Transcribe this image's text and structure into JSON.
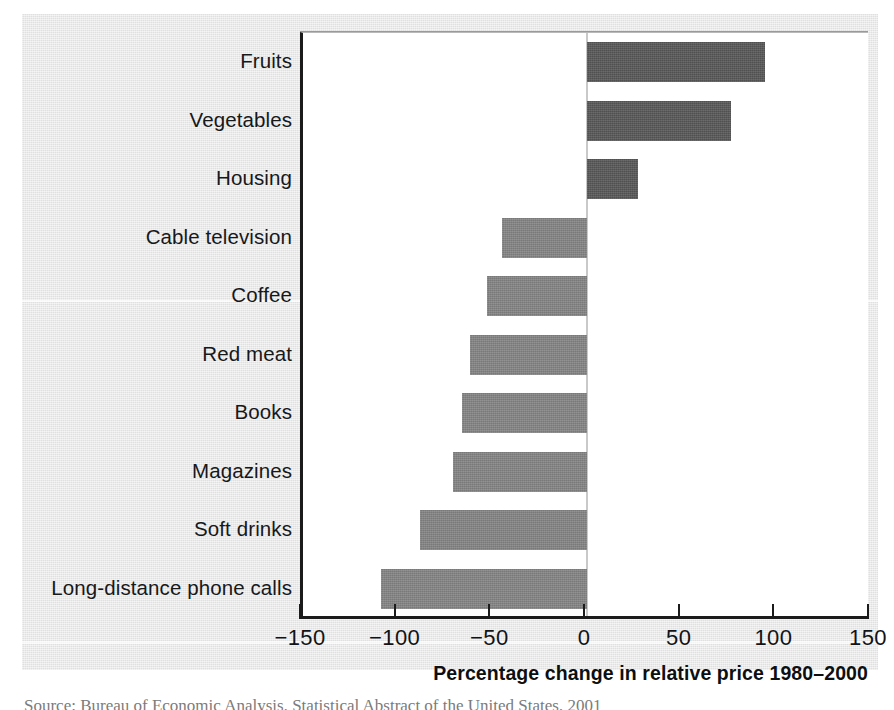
{
  "figure": {
    "background_color": "#e7e7e7",
    "plot_background_color": "#ffffff",
    "positive_bar_color": "#575757",
    "negative_bar_color": "#848484",
    "axis_color": "#1b1b1b",
    "zero_line_color": "#c9c9c9"
  },
  "source_note": "Source: Bureau of Economic Analysis, Statistical Abstract of the United States, 2001",
  "chart_data": {
    "type": "bar",
    "orientation": "horizontal",
    "title": "",
    "xlabel": "Percentage change in relative price 1980–2000",
    "ylabel": "",
    "xlim": [
      -150,
      150
    ],
    "xticks": [
      -150,
      -100,
      -50,
      0,
      50,
      100,
      150
    ],
    "xtick_labels": [
      "−150",
      "−100",
      "−50",
      "0",
      "50",
      "100",
      "150"
    ],
    "grid": false,
    "legend": "none",
    "zero_reference": 0,
    "categories": [
      "Fruits",
      "Vegetables",
      "Housing",
      "Cable television",
      "Coffee",
      "Red meat",
      "Books",
      "Magazines",
      "Soft drinks",
      "Long-distance phone calls"
    ],
    "values": [
      94,
      76,
      27,
      -45,
      -53,
      -62,
      -66,
      -71,
      -88,
      -109
    ],
    "bars": [
      {
        "label": "Fruits",
        "value": 94,
        "sign": "positive"
      },
      {
        "label": "Vegetables",
        "value": 76,
        "sign": "positive"
      },
      {
        "label": "Housing",
        "value": 27,
        "sign": "positive"
      },
      {
        "label": "Cable television",
        "value": -45,
        "sign": "negative"
      },
      {
        "label": "Coffee",
        "value": -53,
        "sign": "negative"
      },
      {
        "label": "Red meat",
        "value": -62,
        "sign": "negative"
      },
      {
        "label": "Books",
        "value": -66,
        "sign": "negative"
      },
      {
        "label": "Magazines",
        "value": -71,
        "sign": "negative"
      },
      {
        "label": "Soft drinks",
        "value": -88,
        "sign": "negative"
      },
      {
        "label": "Long-distance phone calls",
        "value": -109,
        "sign": "negative"
      }
    ]
  }
}
